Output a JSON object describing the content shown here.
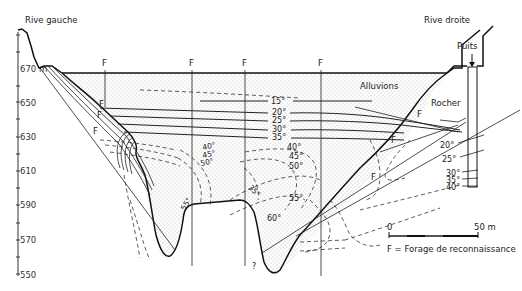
{
  "diagram": {
    "type": "geological-cross-section",
    "labels": {
      "left_bank": "Rive gauche",
      "right_bank": "Rive droite",
      "well": "Puits",
      "alluvium": "Alluvions",
      "rock": "Rocher",
      "borehole_marker": "F",
      "unknown_marker": "?"
    },
    "y_axis": {
      "unit": "m",
      "ticks": [
        "670 m",
        "650",
        "630",
        "610",
        "590",
        "570",
        "550"
      ]
    },
    "isotherms": {
      "central": [
        "15°",
        "20°",
        "25°",
        "30°",
        "35°",
        "40°",
        "45°",
        "50°",
        "55°",
        "60°"
      ],
      "left": [
        "40°",
        "45°",
        "50°",
        "55°"
      ],
      "middle": [
        "35°"
      ],
      "right_well": [
        "20°",
        "25°",
        "30°",
        "35°",
        "40°"
      ]
    },
    "boreholes": [
      "F",
      "F",
      "F",
      "F",
      "F",
      "F",
      "F",
      "F",
      "F"
    ],
    "scale_bar": {
      "start": "0",
      "end": "50 m"
    },
    "legend": {
      "text": "F = Forage de reconnaissance"
    },
    "colors": {
      "ink": "#111111",
      "background": "#ffffff",
      "stipple": "#777777"
    }
  }
}
